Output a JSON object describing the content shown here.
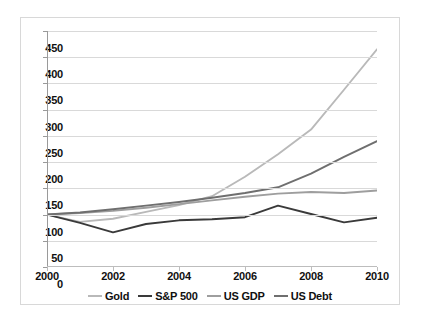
{
  "chart_data": {
    "type": "line",
    "title": "",
    "xlabel": "",
    "ylabel": "",
    "xlim": [
      2000,
      2010
    ],
    "ylim": [
      0,
      450
    ],
    "grid": true,
    "legend_position": "bottom",
    "x": [
      2000,
      2001,
      2002,
      2003,
      2004,
      2005,
      2006,
      2007,
      2008,
      2009,
      2010
    ],
    "y_ticks": [
      0,
      50,
      100,
      150,
      200,
      250,
      300,
      350,
      400,
      450
    ],
    "x_ticks": [
      2000,
      2002,
      2004,
      2006,
      2008,
      2010
    ],
    "x_tick_labels": [
      "2000",
      "2002",
      "2004",
      "2006",
      "2008",
      "2010"
    ],
    "y_tick_labels": [
      "0",
      "50",
      "100",
      "150",
      "200",
      "250",
      "300",
      "350",
      "400",
      "450"
    ],
    "series": [
      {
        "name": "Gold",
        "color": "#b9b9b9",
        "values": [
          100,
          86,
          92,
          105,
          118,
          135,
          172,
          215,
          262,
          338,
          415
        ]
      },
      {
        "name": "S&P 500",
        "color": "#3a3a3a",
        "values": [
          100,
          84,
          66,
          82,
          89,
          91,
          95,
          117,
          101,
          85,
          94
        ]
      },
      {
        "name": "US GDP",
        "color": "#9e9e9e",
        "values": [
          100,
          103,
          107,
          113,
          120,
          127,
          134,
          140,
          143,
          141,
          146
        ]
      },
      {
        "name": "US Debt",
        "color": "#6f6f6f",
        "values": [
          100,
          104,
          110,
          117,
          124,
          132,
          141,
          152,
          178,
          210,
          240
        ]
      }
    ]
  },
  "legend": {
    "items": [
      {
        "label": "Gold",
        "color": "#b9b9b9"
      },
      {
        "label": "S&P 500",
        "color": "#3a3a3a"
      },
      {
        "label": "US GDP",
        "color": "#9e9e9e"
      },
      {
        "label": "US Debt",
        "color": "#6f6f6f"
      }
    ]
  },
  "colors": {
    "background": "#ffffff",
    "gridline": "#d9d9d9",
    "axis": "#9a9a9a",
    "border": "#d8d8d8",
    "text": "#101010"
  }
}
